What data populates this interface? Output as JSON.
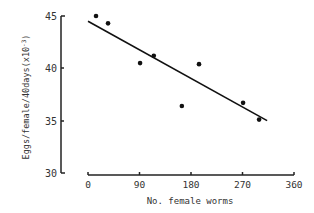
{
  "chart_data": {
    "type": "scatter",
    "title": "",
    "xlabel": "No. female worms",
    "ylabel": "Eggs/female/40days(x10^-3)",
    "xlim": [
      0,
      360
    ],
    "ylim": [
      30,
      45
    ],
    "xticks": [
      "0",
      "90",
      "180",
      "270",
      "360"
    ],
    "yticks": [
      "30",
      "35",
      "40",
      "45"
    ],
    "grid": false,
    "legend": null,
    "series": [
      {
        "name": "observations",
        "points": [
          {
            "x": 14,
            "y": 45.0
          },
          {
            "x": 35,
            "y": 44.3
          },
          {
            "x": 91,
            "y": 40.5
          },
          {
            "x": 115,
            "y": 41.2
          },
          {
            "x": 164,
            "y": 36.4
          },
          {
            "x": 194,
            "y": 40.4
          },
          {
            "x": 271,
            "y": 36.7
          },
          {
            "x": 299,
            "y": 35.1
          }
        ]
      }
    ],
    "regression_line": {
      "x0": 0,
      "y0": 44.5,
      "x1": 313,
      "y1": 35.0
    }
  },
  "labels": {
    "xlabel": "No. female worms",
    "ylabel_main": "Eggs/female/40days(x10",
    "ylabel_exp": "-3",
    "ylabel_close": ")",
    "xticks": [
      "0",
      "90",
      "180",
      "270",
      "360"
    ],
    "yticks": [
      "45",
      "40",
      "35",
      "30"
    ]
  }
}
